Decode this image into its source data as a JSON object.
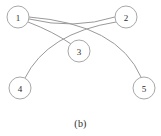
{
  "figure": {
    "caption": "(b)",
    "type": "undirected-graph",
    "width": 161,
    "height": 136,
    "background_color": "#ffffff",
    "node_fill_color": "#ffffff",
    "node_stroke_color": "#a8a8a8",
    "edge_color": "#9a9a9a",
    "label_color": "#2b2b2b"
  },
  "graph": {
    "nodes": [
      {
        "id": "1",
        "label": "1",
        "cx": 18,
        "cy": 17,
        "r": 11
      },
      {
        "id": "2",
        "label": "2",
        "cx": 126,
        "cy": 17,
        "r": 11
      },
      {
        "id": "3",
        "label": "3",
        "cx": 79,
        "cy": 51,
        "r": 11
      },
      {
        "id": "4",
        "label": "4",
        "cx": 20,
        "cy": 88,
        "r": 11
      },
      {
        "id": "5",
        "label": "5",
        "cx": 144,
        "cy": 88,
        "r": 11
      }
    ],
    "edges": [
      {
        "id": "e-1-2",
        "source": "1",
        "target": "2",
        "path": "M 29 19 Q 74 30 115 17"
      },
      {
        "id": "e-1-3",
        "source": "1",
        "target": "3",
        "path": "M 28 22 Q 54 32 71 44"
      },
      {
        "id": "e-1-5",
        "source": "1",
        "target": "5",
        "path": "M 29 17 Q 118 24 141 77"
      },
      {
        "id": "e-2-4",
        "source": "2",
        "target": "4",
        "path": "M 116 22 Q 47 33 25 78"
      }
    ]
  }
}
